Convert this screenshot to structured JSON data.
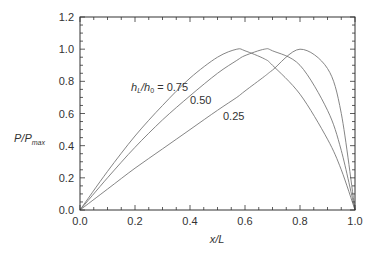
{
  "chart_data": {
    "type": "line",
    "title": "",
    "xlabel": "x/L",
    "ylabel": "P/P_max",
    "ylabel_main": "P/P",
    "ylabel_sub": "max",
    "xlim": [
      0.0,
      1.0
    ],
    "ylim": [
      0.0,
      1.2
    ],
    "grid": false,
    "legend_position": "inline annotations",
    "x_ticks": [
      "0.0",
      "0.2",
      "0.4",
      "0.6",
      "0.8",
      "1.0"
    ],
    "y_ticks": [
      "0.0",
      "0.2",
      "0.4",
      "0.6",
      "0.8",
      "1.0",
      "1.2"
    ],
    "annotation_param_main": "h",
    "annotation_param_sub1": "L",
    "annotation_param_mid": "/h",
    "annotation_param_sub2": "0",
    "annotation_param_eq": " = 0.75",
    "annotations": [
      "hL/h0 = 0.75",
      "0.50",
      "0.25"
    ],
    "x": [
      0.0,
      0.1,
      0.2,
      0.3,
      0.4,
      0.5,
      0.57,
      0.6,
      0.67,
      0.7,
      0.8,
      0.9,
      0.95,
      1.0
    ],
    "series": [
      {
        "name": "hL/h0 = 0.75",
        "peak_x": 0.57,
        "values": [
          0.0,
          0.24,
          0.46,
          0.65,
          0.82,
          0.95,
          1.0,
          0.99,
          0.94,
          0.9,
          0.72,
          0.44,
          0.25,
          0.0
        ]
      },
      {
        "name": "hL/h0 = 0.50",
        "peak_x": 0.67,
        "values": [
          0.0,
          0.2,
          0.39,
          0.56,
          0.71,
          0.85,
          0.93,
          0.96,
          1.0,
          0.99,
          0.9,
          0.62,
          0.37,
          0.0
        ]
      },
      {
        "name": "hL/h0 = 0.25",
        "peak_x": 0.8,
        "values": [
          0.0,
          0.13,
          0.26,
          0.38,
          0.5,
          0.62,
          0.7,
          0.74,
          0.83,
          0.87,
          1.0,
          0.88,
          0.6,
          0.0
        ]
      }
    ],
    "line_color": "#777777",
    "axis_color": "#333333"
  }
}
